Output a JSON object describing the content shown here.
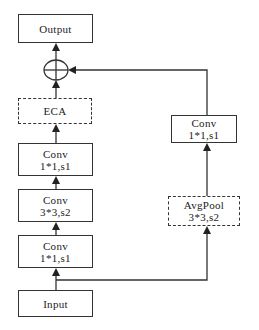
{
  "diagram": {
    "main_branch": {
      "output": {
        "label": "Output"
      },
      "add": {
        "symbol": "⊕",
        "name": "element-wise add"
      },
      "eca": {
        "label": "ECA",
        "style": "dashed"
      },
      "conv3": {
        "line1": "Conv",
        "line2": "1*1,s1"
      },
      "conv2": {
        "line1": "Conv",
        "line2": "3*3,s2"
      },
      "conv1": {
        "line1": "Conv",
        "line2": "1*1,s1"
      },
      "input": {
        "label": "Input"
      }
    },
    "shortcut_branch": {
      "avgpool": {
        "line1": "AvgPool",
        "line2": "3*3,s2",
        "style": "dashed"
      },
      "conv": {
        "line1": "Conv",
        "line2": "1*1,s1"
      }
    },
    "colors": {
      "line": "#333333",
      "background": "#ffffff",
      "text": "#222222"
    }
  }
}
